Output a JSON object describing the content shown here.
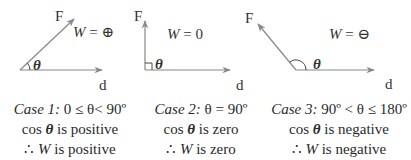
{
  "colors": {
    "arrow": "#888888",
    "text": "#2a2a2a"
  },
  "vector_labels": {
    "force": "F",
    "displacement": "d",
    "angle": "θ"
  },
  "cases": [
    {
      "work_label": "W",
      "work_eq": " = ",
      "work_value_symbol": "plus-in-circle",
      "work_value_text": "⊕",
      "caption": {
        "case": "Case 1:",
        "condition": "0 ≤ θ< 90º",
        "cos_prefix": "cos ",
        "theta": "θ",
        "cos_suffix": " is positive",
        "therefore": "∴ ",
        "w": "W",
        "w_suffix": " is positive"
      }
    },
    {
      "work_label": "W",
      "work_eq": " = ",
      "work_value_text": "0",
      "caption": {
        "case": "Case 2:",
        "condition": "θ = 90º",
        "cos_prefix": "cos ",
        "theta": "θ",
        "cos_suffix": " is zero",
        "therefore": "∴ ",
        "w": "W",
        "w_suffix": " is zero"
      }
    },
    {
      "work_label": "W",
      "work_eq": " = ",
      "work_value_symbol": "minus-in-circle",
      "work_value_text": "⊖",
      "caption": {
        "case": "Case 3:",
        "condition": "90º < θ ≤ 180º",
        "cos_prefix": "cos ",
        "theta": "θ",
        "cos_suffix": " is negative",
        "therefore": "∴ ",
        "w": "W",
        "w_suffix": " is negative"
      }
    }
  ]
}
